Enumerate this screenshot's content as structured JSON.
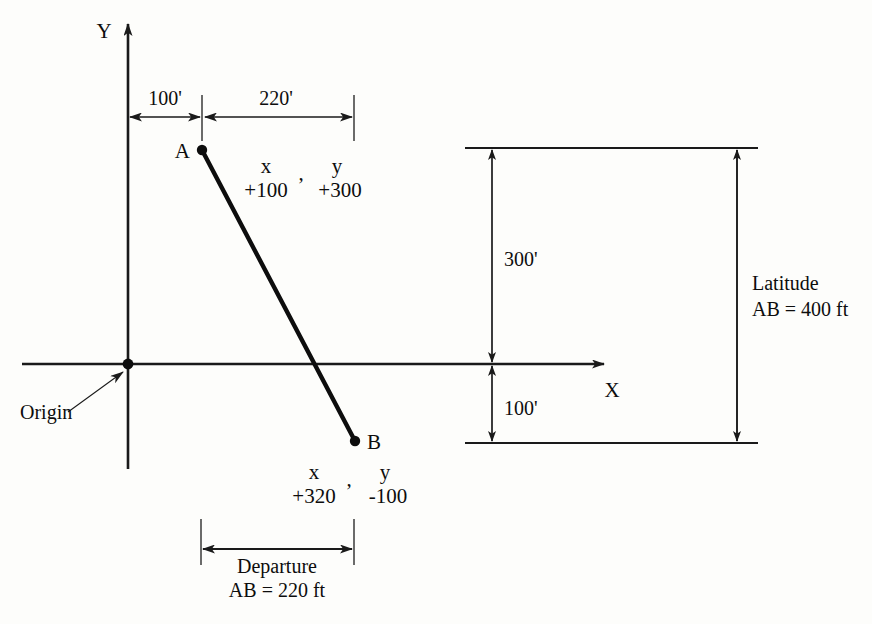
{
  "figure": {
    "kind": "surveying-latitude-departure-diagram",
    "axes": {
      "y_axis_label": "Y",
      "x_axis_label": "X",
      "origin_label": "Origin"
    },
    "points": [
      {
        "id": "A",
        "label": "A",
        "coord_header_x": "x",
        "coord_header_sep": ",",
        "coord_header_y": "y",
        "coord_value_x": "+100",
        "coord_value_y": "+300"
      },
      {
        "id": "B",
        "label": "B",
        "coord_header_x": "x",
        "coord_header_sep": ",",
        "coord_header_y": "y",
        "coord_value_x": "+320",
        "coord_value_y": "-100"
      }
    ],
    "horizontal_dimensions": [
      {
        "name": "offset-to-A",
        "label": "100'"
      },
      {
        "name": "departure-run",
        "label": "220'"
      }
    ],
    "vertical_dimensions": [
      {
        "name": "above-axis",
        "label": "300'"
      },
      {
        "name": "below-axis",
        "label": "100'"
      }
    ],
    "callouts": [
      {
        "name": "departure",
        "title": "Departure",
        "value": "AB = 220 ft"
      },
      {
        "name": "latitude",
        "title": "Latitude",
        "value": "AB = 400 ft"
      }
    ],
    "colors": {
      "ink": "#0d0d0d",
      "line": "#1a1a1a",
      "thin": "#3a3a3a",
      "background": "#fdfdfb"
    }
  }
}
